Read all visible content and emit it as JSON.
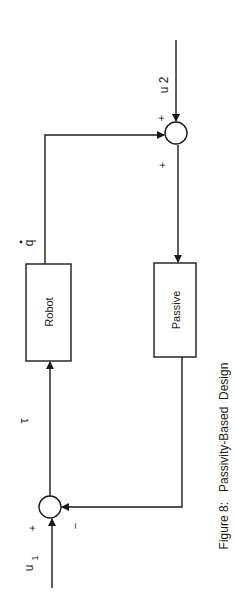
{
  "diagram": {
    "caption": "Figure 8:   Passivity-Based  Design",
    "blocks": {
      "robot": "Robot",
      "passive": "Passive"
    },
    "signals": {
      "u1": "u",
      "u1_sub": "1",
      "u2": "u 2",
      "tau": "τ",
      "qdot": "q"
    },
    "junction_signs": {
      "top_input_u2": "+",
      "top_input_feedback": "+",
      "bottom_input_u1": "+",
      "bottom_input_feedback": "−"
    },
    "colors": {
      "stroke": "#1a1a1a",
      "background": "#ffffff"
    }
  }
}
